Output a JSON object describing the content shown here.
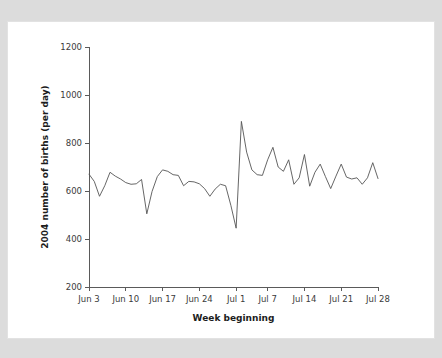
{
  "figure": {
    "background_color": "#dcdcdc",
    "sheet_color": "#ffffff",
    "line_color": "#555555",
    "text_color": "#3b3b3b"
  },
  "chart_data": {
    "type": "line",
    "title": "",
    "subtitle": "",
    "xlabel": "Week beginning",
    "ylabel": "2004 number of births (per day)",
    "ylim": [
      200,
      1200
    ],
    "ytick_labels": [
      "200",
      "400",
      "600",
      "800",
      "1000",
      "1200"
    ],
    "ytick_values": [
      200,
      400,
      600,
      800,
      1000,
      1200
    ],
    "xtick_labels": [
      "Jun 3",
      "Jun 10",
      "Jun 17",
      "Jun 24",
      "Jul 1",
      "Jul 7",
      "Jul 14",
      "Jul 21",
      "Jul 28"
    ],
    "xtick_days": [
      0,
      7,
      14,
      21,
      28,
      34,
      41,
      48,
      55
    ],
    "xlim_days": [
      0,
      55
    ],
    "grid": false,
    "legend": null,
    "legend_position": "none",
    "annotations": [],
    "series": [
      {
        "name": "2004 number of births (per day)",
        "color": "#555555",
        "x": [
          0,
          1,
          2,
          3,
          4,
          5,
          6,
          7,
          8,
          9,
          10,
          11,
          12,
          13,
          14,
          15,
          16,
          17,
          18,
          19,
          20,
          21,
          22,
          23,
          24,
          25,
          26,
          27,
          28,
          29,
          30,
          31,
          32,
          33,
          34,
          35,
          36,
          37,
          38,
          39,
          40,
          41,
          42,
          43,
          44,
          45,
          46,
          47,
          48,
          49,
          50,
          51,
          52,
          53,
          54,
          55
        ],
        "values": [
          670,
          640,
          578,
          622,
          678,
          662,
          650,
          635,
          628,
          630,
          648,
          505,
          598,
          660,
          688,
          682,
          668,
          665,
          622,
          640,
          638,
          630,
          610,
          578,
          608,
          628,
          622,
          540,
          445,
          890,
          762,
          688,
          668,
          665,
          730,
          782,
          700,
          682,
          730,
          628,
          655,
          752,
          620,
          678,
          712,
          660,
          610,
          662,
          712,
          658,
          650,
          655,
          628,
          655,
          718,
          652
        ]
      }
    ]
  }
}
